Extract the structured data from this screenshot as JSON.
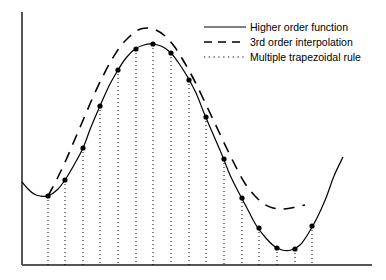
{
  "chart_data": {
    "type": "line",
    "title": "",
    "xlabel": "",
    "ylabel": "",
    "grid": false,
    "legend_position": "top-right",
    "axis": {
      "x_range": [
        0,
        386
      ],
      "y_range": [
        0,
        280
      ],
      "x_axis_pixel_y": 265,
      "y_axis_pixel_x": 22,
      "x_axis_extent": [
        22,
        372
      ],
      "y_axis_extent": [
        12,
        265
      ],
      "axis_color": "#555555"
    },
    "series": [
      {
        "name": "Higher order function",
        "style": "solid",
        "color": "#000000",
        "markers": true,
        "points": [
          [
            22,
            182
          ],
          [
            28,
            189
          ],
          [
            34,
            194
          ],
          [
            40,
            196
          ],
          [
            48,
            196
          ],
          [
            57,
            190
          ],
          [
            65,
            180
          ],
          [
            74,
            165
          ],
          [
            83,
            148
          ],
          [
            91,
            127
          ],
          [
            100,
            106
          ],
          [
            109,
            86
          ],
          [
            118,
            70
          ],
          [
            126,
            58
          ],
          [
            135,
            49
          ],
          [
            144,
            45
          ],
          [
            152,
            44
          ],
          [
            161,
            46
          ],
          [
            170,
            52
          ],
          [
            178,
            62
          ],
          [
            187,
            76
          ],
          [
            196,
            93
          ],
          [
            204,
            113
          ],
          [
            213,
            134
          ],
          [
            222,
            155
          ],
          [
            230,
            175
          ],
          [
            239,
            193
          ],
          [
            248,
            210
          ],
          [
            256,
            225
          ],
          [
            265,
            237
          ],
          [
            274,
            246
          ],
          [
            282,
            250
          ],
          [
            291,
            250
          ],
          [
            300,
            245
          ],
          [
            308,
            234
          ],
          [
            317,
            218
          ],
          [
            326,
            198
          ],
          [
            334,
            176
          ],
          [
            343,
            157
          ]
        ]
      },
      {
        "name": "3rd order interpolation",
        "style": "dashed",
        "color": "#000000",
        "markers": false,
        "points": [
          [
            48,
            196
          ],
          [
            57,
            179
          ],
          [
            66,
            160
          ],
          [
            75,
            139
          ],
          [
            84,
            118
          ],
          [
            93,
            97
          ],
          [
            102,
            78
          ],
          [
            111,
            61
          ],
          [
            120,
            47
          ],
          [
            129,
            37
          ],
          [
            138,
            30
          ],
          [
            147,
            28
          ],
          [
            156,
            30
          ],
          [
            165,
            36
          ],
          [
            174,
            46
          ],
          [
            183,
            60
          ],
          [
            192,
            76
          ],
          [
            201,
            94
          ],
          [
            210,
            113
          ],
          [
            219,
            132
          ],
          [
            228,
            151
          ],
          [
            237,
            169
          ],
          [
            246,
            185
          ],
          [
            255,
            196
          ],
          [
            264,
            204
          ],
          [
            273,
            208
          ],
          [
            282,
            209
          ],
          [
            291,
            208
          ],
          [
            300,
            206
          ],
          [
            305,
            205
          ]
        ]
      }
    ],
    "trapezoid_nodes": {
      "name": "Multiple trapezoidal rule",
      "style": "dotted",
      "color": "#000000",
      "baseline_y": 265,
      "nodes": [
        {
          "x": 48,
          "y": 196
        },
        {
          "x": 65,
          "y": 180
        },
        {
          "x": 83,
          "y": 148
        },
        {
          "x": 100,
          "y": 106
        },
        {
          "x": 118,
          "y": 70
        },
        {
          "x": 136,
          "y": 49
        },
        {
          "x": 153,
          "y": 44
        },
        {
          "x": 171,
          "y": 53
        },
        {
          "x": 189,
          "y": 80
        },
        {
          "x": 206,
          "y": 117
        },
        {
          "x": 224,
          "y": 159
        },
        {
          "x": 242,
          "y": 198
        },
        {
          "x": 259,
          "y": 228
        },
        {
          "x": 277,
          "y": 248
        },
        {
          "x": 295,
          "y": 249
        },
        {
          "x": 312,
          "y": 226
        }
      ]
    }
  },
  "legend": {
    "items": [
      {
        "label": "Higher order function",
        "style": "solid"
      },
      {
        "label": "3rd order interpolation",
        "style": "dashed"
      },
      {
        "label": "Multiple trapezoidal rule",
        "style": "dotted"
      }
    ]
  }
}
